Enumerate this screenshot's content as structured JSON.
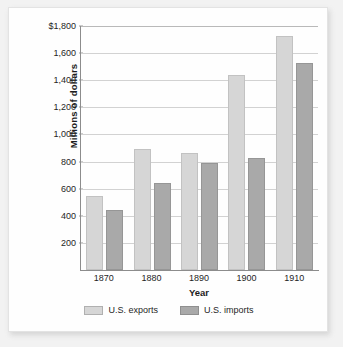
{
  "chart_data": {
    "type": "bar",
    "title": "",
    "subtitle": "",
    "xlabel": "Year",
    "ylabel": "Millions of dollars",
    "categories": [
      "1870",
      "1880",
      "1890",
      "1900",
      "1910"
    ],
    "series": [
      {
        "name": "U.S. exports",
        "color": "#d6d6d6",
        "values": [
          545,
          890,
          865,
          1435,
          1730
        ]
      },
      {
        "name": "U.S. imports",
        "color": "#a9a9a9",
        "values": [
          445,
          640,
          790,
          830,
          1530
        ]
      }
    ],
    "ylim": [
      0,
      1800
    ],
    "ytick_values": [
      1800,
      1600,
      1400,
      1200,
      1000,
      800,
      600,
      400,
      200
    ],
    "ytick_labels": [
      "$1,800",
      "1,600",
      "1,400",
      "1,200",
      "1,000",
      "800",
      "600",
      "400",
      "200"
    ],
    "grid": true,
    "grid_axis": "y",
    "legend_position": "bottom",
    "legend": [
      "U.S. exports",
      "U.S. imports"
    ]
  },
  "axes": {
    "y_title": "Millions of dollars",
    "x_title": "Year"
  }
}
